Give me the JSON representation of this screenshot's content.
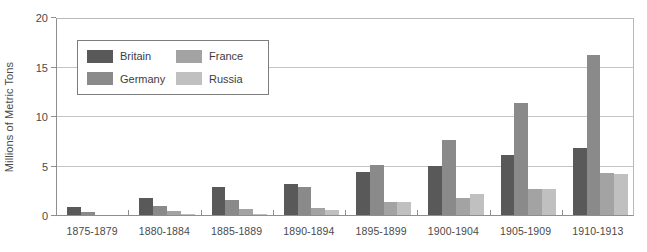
{
  "chart_data": {
    "type": "bar",
    "title": "",
    "xlabel": "",
    "ylabel": "Millions of Metric Tons",
    "ylim": [
      0,
      20
    ],
    "yticks": [
      0,
      5,
      10,
      15,
      20
    ],
    "grid": true,
    "legend_position": "upper-left-inside",
    "categories": [
      "1875-1879",
      "1880-1884",
      "1885-1889",
      "1890-1894",
      "1895-1899",
      "1900-1904",
      "1905-1909",
      "1910-1913"
    ],
    "series": [
      {
        "name": "Britain",
        "color": "#595959",
        "values": [
          0.9,
          1.8,
          2.9,
          3.2,
          4.4,
          5.1,
          6.2,
          6.9
        ]
      },
      {
        "name": "Germany",
        "color": "#8a8a8a",
        "values": [
          0.4,
          1.0,
          1.6,
          2.9,
          5.2,
          7.7,
          11.4,
          16.3
        ]
      },
      {
        "name": "France",
        "color": "#a3a3a3",
        "values": [
          0.1,
          0.5,
          0.7,
          0.8,
          1.4,
          1.8,
          2.7,
          4.3
        ]
      },
      {
        "name": "Russia",
        "color": "#c0c0c0",
        "values": [
          0.1,
          0.2,
          0.2,
          0.6,
          1.4,
          2.2,
          2.7,
          4.2
        ]
      }
    ]
  }
}
